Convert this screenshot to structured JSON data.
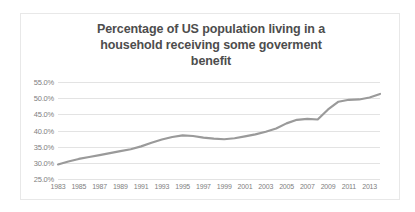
{
  "chart_data": {
    "type": "line",
    "title": "Percentage of US population living in a household receiving some goverment benefit",
    "title_lines": [
      "Percentage of US population living in a",
      "household receiving some goverment",
      "benefit"
    ],
    "xlabel": "",
    "ylabel": "",
    "grid": true,
    "legend": "none",
    "line_color": "#9a9a9a",
    "grid_color": "#e3e3e3",
    "tick_color": "#808080",
    "title_color": "#4d4d4d",
    "xlim": [
      1983,
      2014
    ],
    "ylim": [
      25.0,
      55.0
    ],
    "y_ticks": [
      55.0,
      50.0,
      45.0,
      40.0,
      35.0,
      30.0,
      25.0
    ],
    "y_tick_labels": [
      "55.0%",
      "50.0%",
      "45.0%",
      "40.0%",
      "35.0%",
      "30.0%",
      "25.0%"
    ],
    "x_ticks": [
      1983,
      1985,
      1987,
      1989,
      1991,
      1993,
      1995,
      1997,
      1999,
      2001,
      2003,
      2005,
      2007,
      2009,
      2011,
      2013
    ],
    "x_tick_labels": [
      "1983",
      "1985",
      "1987",
      "1989",
      "1991",
      "1993",
      "1995",
      "1997",
      "1999",
      "2001",
      "2003",
      "2005",
      "2007",
      "2009",
      "2011",
      "2013"
    ],
    "series": [
      {
        "name": "Percent of US population in a household receiving a government benefit",
        "x": [
          1983,
          1984,
          1985,
          1986,
          1987,
          1988,
          1989,
          1990,
          1991,
          1992,
          1993,
          1994,
          1995,
          1996,
          1997,
          1998,
          1999,
          2000,
          2001,
          2002,
          2003,
          2004,
          2005,
          2006,
          2007,
          2008,
          2009,
          2010,
          2011,
          2012,
          2013,
          2014
        ],
        "values": [
          29.5,
          30.4,
          31.2,
          31.8,
          32.4,
          33.0,
          33.6,
          34.2,
          35.1,
          36.2,
          37.2,
          38.0,
          38.5,
          38.3,
          37.8,
          37.5,
          37.3,
          37.6,
          38.2,
          38.8,
          39.6,
          40.6,
          42.2,
          43.3,
          43.6,
          43.4,
          46.5,
          48.9,
          49.5,
          49.6,
          50.2,
          51.3
        ]
      }
    ]
  }
}
